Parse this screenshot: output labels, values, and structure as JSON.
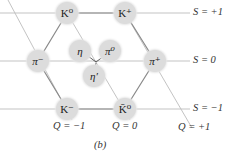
{
  "diagram": {
    "type": "meson-octet-weight-diagram",
    "caption": "(b)",
    "colors": {
      "line": "#b5b5b5",
      "edge": "#808080",
      "node": "#dcdcdc",
      "text": "#222222"
    },
    "nodes": [
      {
        "id": "K0",
        "label": "K⁰",
        "x": 67,
        "y": 13
      },
      {
        "id": "Kplus",
        "label": "K⁺",
        "x": 125,
        "y": 13
      },
      {
        "id": "piminus",
        "label": "π⁻",
        "x": 38,
        "y": 61
      },
      {
        "id": "piplus",
        "label": "π⁺",
        "x": 155,
        "y": 61
      },
      {
        "id": "Kminus",
        "label": "K⁻",
        "x": 67,
        "y": 109
      },
      {
        "id": "K0bar",
        "label": "K̄⁰",
        "x": 125,
        "y": 109
      },
      {
        "id": "eta",
        "label": "η",
        "x": 80,
        "y": 51
      },
      {
        "id": "pi0",
        "label": "π⁰",
        "x": 110,
        "y": 51
      },
      {
        "id": "etaprime",
        "label": "η′",
        "x": 94,
        "y": 76
      }
    ],
    "strangeness_labels": [
      {
        "text": "S = +1",
        "y": 13
      },
      {
        "text": "S = 0",
        "y": 61
      },
      {
        "text": "S = −1",
        "y": 109
      }
    ],
    "charge_labels": [
      {
        "text": "Q = −1",
        "x": 67
      },
      {
        "text": "Q = 0",
        "x": 125
      },
      {
        "text": "Q = +1",
        "x": 185
      }
    ]
  }
}
